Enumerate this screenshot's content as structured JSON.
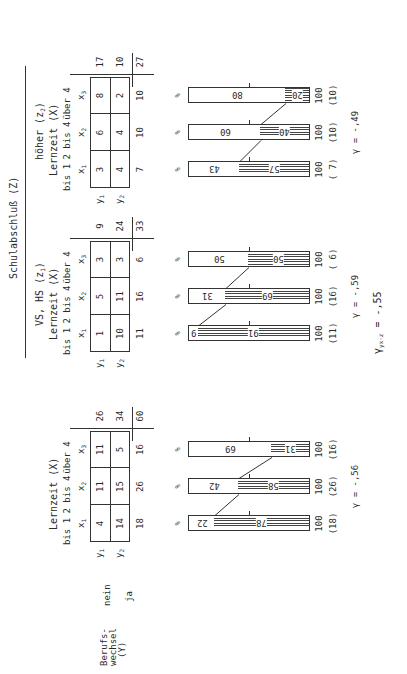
{
  "header": {
    "title": "Schulabschluß (Z)",
    "z1_label": "VS, HS (z",
    "z1_sub": "1",
    "z2_label": "höher (z",
    "z2_sub": "2",
    "close_paren": ")"
  },
  "row_variable": {
    "label_line1": "Berufs-",
    "label_line2": "wechsel",
    "label_line3": "(Y)",
    "y1_label": "nein",
    "y2_label": "ja",
    "y1_symbol": "y",
    "y1_sub": "1",
    "y2_symbol": "y",
    "y2_sub": "2"
  },
  "column_variable": {
    "label": "Lernzeit (X)",
    "categories": [
      "bis 1",
      "2 bis 4",
      "über 4"
    ],
    "symbols": [
      "x",
      "x",
      "x"
    ],
    "subs": [
      "1",
      "2",
      "3"
    ]
  },
  "percent_sign": "%",
  "chart_data": [
    {
      "type": "table",
      "title": "Gesamt",
      "rows": [
        "y1 nein",
        "y2 ja"
      ],
      "columns": [
        "x1 bis 1",
        "x2 2 bis 4",
        "x3 über 4"
      ],
      "cells": [
        [
          4,
          11,
          11
        ],
        [
          14,
          15,
          5
        ]
      ],
      "row_totals": [
        26,
        34
      ],
      "col_totals": [
        18,
        26,
        16
      ],
      "grand_total": 60,
      "bars": {
        "type": "bar",
        "stacked": true,
        "categories": [
          "x1",
          "x2",
          "x3"
        ],
        "series": [
          {
            "name": "y1 nein (%)",
            "values": [
              22,
              42,
              69
            ]
          },
          {
            "name": "y2 ja (%)",
            "values": [
              78,
              58,
              31
            ]
          }
        ],
        "totals": [
          "100",
          "100",
          "100"
        ],
        "n": [
          "(18)",
          "(26)",
          "(16)"
        ]
      },
      "gamma": "γ = -.56"
    },
    {
      "type": "table",
      "title": "VS, HS (z1)",
      "rows": [
        "y1 nein",
        "y2 ja"
      ],
      "columns": [
        "x1 bis 1",
        "x2 2 bis 4",
        "x3 über 4"
      ],
      "cells": [
        [
          1,
          5,
          3
        ],
        [
          10,
          11,
          3
        ]
      ],
      "row_totals": [
        9,
        24
      ],
      "col_totals": [
        11,
        16,
        6
      ],
      "grand_total": 33,
      "bars": {
        "type": "bar",
        "stacked": true,
        "categories": [
          "x1",
          "x2",
          "x3"
        ],
        "series": [
          {
            "name": "y1 nein (%)",
            "values": [
              9,
              31,
              50
            ]
          },
          {
            "name": "y2 ja (%)",
            "values": [
              91,
              69,
              50
            ]
          }
        ],
        "totals": [
          "100",
          "100",
          "100"
        ],
        "n": [
          "(11)",
          "(16)",
          "( 6)"
        ]
      },
      "gamma": "γ = -.59"
    },
    {
      "type": "table",
      "title": "höher (z2)",
      "rows": [
        "y1 nein",
        "y2 ja"
      ],
      "columns": [
        "x1 bis 1",
        "x2 2 bis 4",
        "x3 über 4"
      ],
      "cells": [
        [
          3,
          6,
          8
        ],
        [
          4,
          4,
          2
        ]
      ],
      "row_totals": [
        17,
        10
      ],
      "col_totals": [
        7,
        10,
        10
      ],
      "grand_total": 27,
      "bars": {
        "type": "bar",
        "stacked": true,
        "categories": [
          "x1",
          "x2",
          "x3"
        ],
        "series": [
          {
            "name": "y1 nein (%)",
            "values": [
              43,
              60,
              80
            ]
          },
          {
            "name": "y2 ja (%)",
            "values": [
              57,
              40,
              20
            ]
          }
        ],
        "totals": [
          "100",
          "100",
          "100"
        ],
        "n": [
          "( 7)",
          "(10)",
          "(10)"
        ]
      },
      "gamma": "γ = -.49"
    }
  ],
  "partial_gamma": {
    "symbol": "γ",
    "sub": "yx·z",
    "value": " = -.55"
  },
  "panels": [
    {
      "cells": [
        [
          "4",
          "11",
          "11"
        ],
        [
          "14",
          "15",
          "5"
        ]
      ],
      "row_totals": [
        "26",
        "34"
      ],
      "col_totals": [
        "18",
        "26",
        "16"
      ],
      "grand_total": "60",
      "white": [
        "22",
        "42",
        "69"
      ],
      "hatch": [
        "78",
        "58",
        "31"
      ],
      "hundred": [
        "100",
        "100",
        "100"
      ],
      "n": [
        "(18)",
        "(26)",
        "(16)"
      ],
      "gamma": "γ = -,56"
    },
    {
      "cells": [
        [
          "1",
          "5",
          "3"
        ],
        [
          "10",
          "11",
          "3"
        ]
      ],
      "row_totals": [
        "9",
        "24"
      ],
      "col_totals": [
        "11",
        "16",
        "6"
      ],
      "grand_total": "33",
      "white": [
        "9",
        "31",
        "50"
      ],
      "hatch": [
        "91",
        "69",
        "50"
      ],
      "hundred": [
        "100",
        "100",
        "100"
      ],
      "n": [
        "(11)",
        "(16)",
        "( 6)"
      ],
      "gamma": "γ = -,59"
    },
    {
      "cells": [
        [
          "3",
          "6",
          "8"
        ],
        [
          "4",
          "4",
          "2"
        ]
      ],
      "row_totals": [
        "17",
        "10"
      ],
      "col_totals": [
        "7",
        "10",
        "10"
      ],
      "grand_total": "27",
      "white": [
        "43",
        "60",
        "80"
      ],
      "hatch": [
        "57",
        "40",
        "20"
      ],
      "hundred": [
        "100",
        "100",
        "100"
      ],
      "n": [
        "( 7)",
        "(10)",
        "(10)"
      ],
      "gamma": "γ = -,49"
    }
  ],
  "partial_gamma_text": " = -,55"
}
